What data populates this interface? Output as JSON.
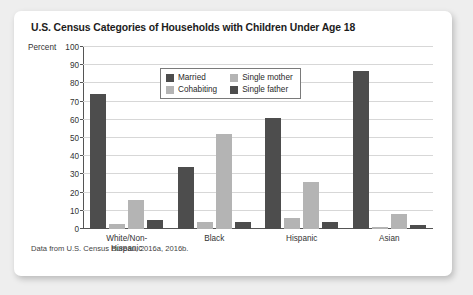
{
  "card": {
    "title": "U.S. Census Categories of Households with Children Under Age 18",
    "source_note": "Data from U.S. Census Bureau, 2016a, 2016b."
  },
  "axis": {
    "y_title": "Percent"
  },
  "legend": {
    "items": [
      {
        "label": "Married",
        "color": "#4d4d4d"
      },
      {
        "label": "Single mother",
        "color": "#b4b4b4"
      },
      {
        "label": "Cohabiting",
        "color": "#b4b4b4"
      },
      {
        "label": "Single father",
        "color": "#4d4d4d"
      }
    ]
  },
  "chart_data": {
    "type": "bar",
    "title": "U.S. Census Categories of Households with Children Under Age 18",
    "xlabel": "",
    "ylabel": "Percent",
    "ylim": [
      0,
      100
    ],
    "yticks": [
      0,
      10,
      20,
      30,
      40,
      50,
      60,
      70,
      80,
      90,
      100
    ],
    "ytick_labels": [
      "0",
      "10",
      "20",
      "30",
      "40",
      "50",
      "60",
      "70",
      "80",
      "90",
      "100"
    ],
    "grid": true,
    "legend_position": "upper-center",
    "categories": [
      "White/Non-Hispanic",
      "Black",
      "Hispanic",
      "Asian"
    ],
    "category_label_lines": [
      [
        "White/Non-",
        "Hispanic"
      ],
      [
        "Black"
      ],
      [
        "Hispanic"
      ],
      [
        "Asian"
      ]
    ],
    "series": [
      {
        "name": "Married",
        "color": "#4d4d4d",
        "values": [
          74,
          34,
          61,
          87
        ]
      },
      {
        "name": "Cohabiting",
        "color": "#b4b4b4",
        "values": [
          3,
          4,
          6,
          1
        ]
      },
      {
        "name": "Single mother",
        "color": "#b4b4b4",
        "values": [
          16,
          52,
          26,
          8
        ]
      },
      {
        "name": "Single father",
        "color": "#4d4d4d",
        "values": [
          5,
          4,
          4,
          2
        ]
      }
    ],
    "annotation": "Data from U.S. Census Bureau, 2016a, 2016b."
  }
}
